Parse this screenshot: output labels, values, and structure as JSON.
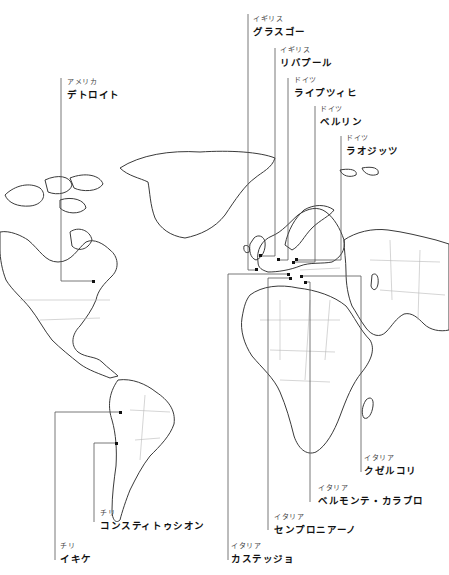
{
  "map": {
    "type": "world-outline-map",
    "projection": "equirectangular-style outline",
    "colors": {
      "coast": "#3a3a3a",
      "border": "#b8b8b8",
      "leader": "#555555",
      "marker": "#111111",
      "background": "#ffffff"
    }
  },
  "labels": [
    {
      "id": "glasgow",
      "country": "イギリス",
      "city": "グラスゴー"
    },
    {
      "id": "liverpool",
      "country": "イギリス",
      "city": "リバプール"
    },
    {
      "id": "leipzig",
      "country": "ドイツ",
      "city": "ライプツィヒ"
    },
    {
      "id": "berlin",
      "country": "ドイツ",
      "city": "ベルリン"
    },
    {
      "id": "lausitz",
      "country": "ドイツ",
      "city": "ラオジッツ"
    },
    {
      "id": "detroit",
      "country": "アメリカ",
      "city": "デトロイト"
    },
    {
      "id": "cuzelcori",
      "country": "イタリア",
      "city": "クゼルコリ"
    },
    {
      "id": "belmonte",
      "country": "イタリア",
      "city": "ベルモンテ・カラブロ"
    },
    {
      "id": "sempronia",
      "country": "イタリア",
      "city": "センプロニアーノ"
    },
    {
      "id": "castegio",
      "country": "イタリア",
      "city": "カステッジョ"
    },
    {
      "id": "constitucion",
      "country": "チリ",
      "city": "コンスティトゥシオン"
    },
    {
      "id": "iquique",
      "country": "チリ",
      "city": "イキケ"
    }
  ]
}
